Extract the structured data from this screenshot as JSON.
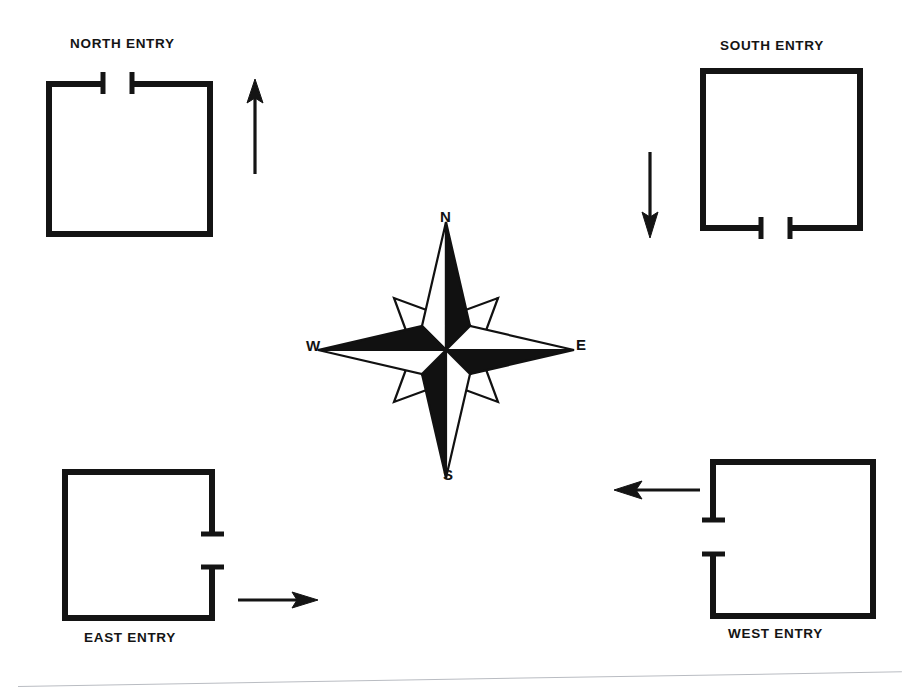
{
  "page": {
    "background_color": "#ffffff",
    "ink_color": "#141414"
  },
  "compass": {
    "name": "compass-rose",
    "points": 8,
    "labels": {
      "north": "N",
      "east": "E",
      "south": "S",
      "west": "W"
    },
    "style": {
      "cardinal_fill": "#111111",
      "intercardinal_fill": "#ffffff",
      "stroke": "#111111"
    }
  },
  "plans": [
    {
      "id": "north",
      "label": "NORTH ENTRY",
      "opening_wall": "top",
      "arrow_direction": "up",
      "arrow_side": "right"
    },
    {
      "id": "south",
      "label": "SOUTH ENTRY",
      "opening_wall": "bottom",
      "arrow_direction": "down",
      "arrow_side": "left"
    },
    {
      "id": "east",
      "label": "EAST ENTRY",
      "opening_wall": "right",
      "arrow_direction": "right",
      "arrow_side": "right"
    },
    {
      "id": "west",
      "label": "WEST ENTRY",
      "opening_wall": "left",
      "arrow_direction": "left",
      "arrow_side": "left"
    }
  ]
}
